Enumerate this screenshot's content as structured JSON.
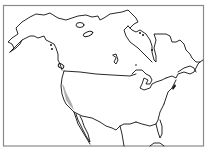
{
  "map": {
    "type": "range-map",
    "region": "North America",
    "colors": {
      "background": "#ffffff",
      "frame": "#8a8a8a",
      "coastline": "#111111",
      "range_fill": "#b0b0b0"
    },
    "highlighted_range": {
      "description": "Pacific coast of California",
      "fill": "#b0b0b0"
    }
  }
}
